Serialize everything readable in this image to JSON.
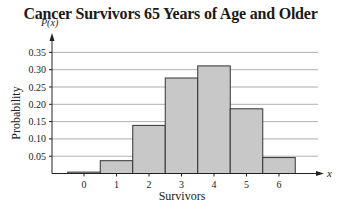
{
  "chart_data": {
    "type": "bar",
    "title": "Cancer Survivors 65 Years of Age and Older",
    "xlabel": "Survivors",
    "ylabel": "Probability",
    "y_axis_symbol": "P(x)",
    "x_axis_symbol": "x",
    "categories": [
      "0",
      "1",
      "2",
      "3",
      "4",
      "5",
      "6"
    ],
    "values": [
      0.004,
      0.037,
      0.139,
      0.276,
      0.311,
      0.187,
      0.046
    ],
    "yticks": [
      "0.05",
      "0.10",
      "0.15",
      "0.20",
      "0.25",
      "0.30",
      "0.35"
    ],
    "ytick_values": [
      0.05,
      0.1,
      0.15,
      0.2,
      0.25,
      0.3,
      0.35
    ],
    "ylim": [
      0,
      0.38
    ],
    "grid": "horizontal",
    "legend": null,
    "bar_fill": "#c8c8c8",
    "bar_stroke": "#333333",
    "grid_color": "#9a9a9a"
  }
}
